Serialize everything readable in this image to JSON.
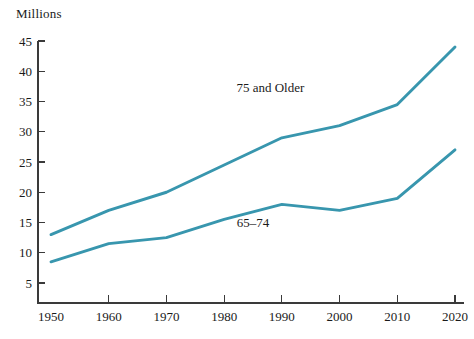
{
  "chart_data": {
    "type": "line",
    "title": "",
    "unit_label": "Millions",
    "xlabel": "",
    "ylabel": "Millions",
    "x": [
      1950,
      1960,
      1970,
      1980,
      1990,
      2000,
      2010,
      2020
    ],
    "categories": [
      "1950",
      "1960",
      "1970",
      "1980",
      "1990",
      "2000",
      "2010",
      "2020"
    ],
    "xlim": [
      1950,
      2020
    ],
    "ylim": [
      0,
      45
    ],
    "y_ticks": [
      5,
      10,
      15,
      20,
      25,
      30,
      35,
      40,
      45
    ],
    "x_ticks": [
      1950,
      1960,
      1970,
      1980,
      1990,
      2000,
      2010,
      2020
    ],
    "grid": false,
    "legend_position": "inline-annotation",
    "series": [
      {
        "name": "75 and Older",
        "color": "#3896ae",
        "values": [
          13,
          17,
          20,
          24.5,
          29,
          31,
          34.5,
          44
        ],
        "label_x": 1988,
        "label_y": 36.5
      },
      {
        "name": "65–74",
        "color": "#3896ae",
        "values": [
          8.5,
          11.5,
          12.5,
          15.5,
          18,
          17,
          19,
          27
        ],
        "label_x": 1985,
        "label_y": 14.2
      }
    ],
    "annotations": [
      {
        "text": "75 and Older",
        "x": 1988,
        "y": 36.5
      },
      {
        "text": "65–74",
        "x": 1985,
        "y": 14.2
      }
    ]
  }
}
